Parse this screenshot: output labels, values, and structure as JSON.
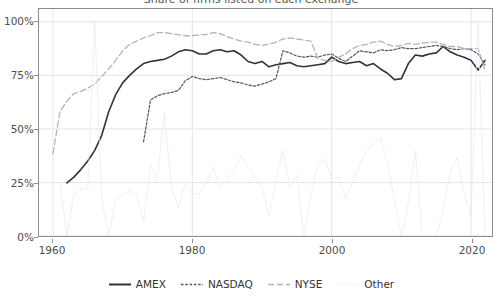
{
  "chart_data": {
    "type": "line",
    "title": "Share of firms listed on each exchange",
    "xlabel": "",
    "ylabel": "",
    "xlim": [
      1958,
      2023
    ],
    "ylim": [
      0,
      1.06
    ],
    "grid": true,
    "grid_color": "#e3e3ee",
    "legend_position": "bottom",
    "x_tick_labels": [
      "1960",
      "1980",
      "2000",
      "2020"
    ],
    "x_ticks": [
      1960,
      1980,
      2000,
      2020
    ],
    "y_tick_labels": [
      "0%",
      "25%",
      "50%",
      "75%",
      "100%"
    ],
    "y_ticks": [
      0,
      25,
      50,
      75,
      100
    ],
    "y_axis_unit": "percent",
    "series": [
      {
        "name": "AMEX",
        "color": "#333333",
        "dash": "solid",
        "width": 1.6,
        "x": [
          1962,
          1963,
          1964,
          1965,
          1966,
          1967,
          1968,
          1969,
          1970,
          1971,
          1972,
          1973,
          1974,
          1975,
          1976,
          1977,
          1978,
          1979,
          1980,
          1981,
          1982,
          1983,
          1984,
          1985,
          1986,
          1987,
          1988,
          1989,
          1990,
          1991,
          1992,
          1993,
          1994,
          1995,
          1996,
          1997,
          1998,
          1999,
          2000,
          2001,
          2002,
          2003,
          2004,
          2005,
          2006,
          2007,
          2008,
          2009,
          2010,
          2011,
          2012,
          2013,
          2014,
          2015,
          2016,
          2017,
          2018,
          2019,
          2020,
          2021,
          2022
        ],
        "values": [
          24.8,
          27.5,
          31.0,
          35.0,
          40.0,
          47.0,
          58.0,
          66.0,
          71.5,
          75.0,
          78.0,
          80.5,
          81.5,
          82.0,
          82.5,
          84.0,
          86.0,
          87.0,
          86.5,
          85.0,
          85.0,
          86.5,
          87.0,
          86.0,
          86.5,
          84.5,
          81.5,
          80.5,
          81.5,
          79.0,
          80.0,
          80.5,
          81.0,
          79.5,
          79.0,
          79.5,
          80.0,
          80.5,
          83.5,
          81.5,
          80.5,
          81.0,
          81.5,
          79.5,
          80.5,
          78.0,
          76.0,
          73.0,
          73.5,
          80.5,
          84.5,
          84.0,
          85.0,
          85.5,
          88.5,
          86.0,
          84.5,
          83.5,
          82.0,
          77.5,
          82.0
        ]
      },
      {
        "name": "NASDAQ",
        "color": "#555566",
        "dash": "dashed-fine",
        "width": 1.2,
        "x": [
          1973,
          1974,
          1975,
          1976,
          1977,
          1978,
          1979,
          1980,
          1981,
          1982,
          1983,
          1984,
          1985,
          1986,
          1987,
          1988,
          1989,
          1990,
          1991,
          1992,
          1993,
          1994,
          1995,
          1996,
          1997,
          1998,
          1999,
          2000,
          2001,
          2002,
          2003,
          2004,
          2005,
          2006,
          2007,
          2008,
          2009,
          2010,
          2011,
          2012,
          2013,
          2014,
          2015,
          2016,
          2017,
          2018,
          2019,
          2020,
          2021,
          2022
        ],
        "values": [
          44.0,
          63.5,
          65.5,
          66.5,
          67.0,
          68.0,
          72.5,
          74.5,
          73.5,
          73.0,
          73.5,
          74.0,
          73.0,
          72.0,
          71.5,
          70.5,
          70.0,
          71.0,
          72.0,
          73.5,
          86.5,
          85.5,
          84.0,
          83.5,
          84.0,
          83.5,
          84.5,
          85.0,
          83.0,
          81.5,
          84.0,
          86.5,
          86.0,
          85.5,
          87.0,
          86.5,
          87.0,
          88.0,
          87.5,
          87.5,
          88.0,
          88.5,
          89.0,
          88.5,
          87.5,
          87.0,
          87.5,
          87.0,
          85.0,
          80.0
        ]
      },
      {
        "name": "NYSE",
        "color": "#b3b3c4",
        "dash": "dashed-long",
        "width": 1.3,
        "x": [
          1960,
          1961,
          1962,
          1963,
          1964,
          1965,
          1966,
          1967,
          1968,
          1969,
          1970,
          1971,
          1972,
          1973,
          1974,
          1975,
          1976,
          1977,
          1978,
          1979,
          1980,
          1981,
          1982,
          1983,
          1984,
          1985,
          1986,
          1987,
          1988,
          1989,
          1990,
          1991,
          1992,
          1993,
          1994,
          1995,
          1996,
          1997,
          1998,
          1999,
          2000,
          2001,
          2002,
          2003,
          2004,
          2005,
          2006,
          2007,
          2008,
          2009,
          2010,
          2011,
          2012,
          2013,
          2014,
          2015,
          2016,
          2017,
          2018,
          2019,
          2020,
          2021,
          2022
        ],
        "values": [
          38.5,
          58.0,
          63.0,
          66.5,
          67.5,
          69.0,
          71.0,
          74.5,
          78.0,
          82.0,
          86.5,
          89.5,
          91.0,
          92.5,
          93.5,
          95.0,
          95.0,
          94.5,
          94.0,
          93.5,
          93.5,
          94.0,
          94.0,
          95.0,
          94.5,
          93.0,
          92.0,
          91.0,
          90.5,
          89.5,
          89.0,
          89.5,
          90.5,
          92.0,
          92.5,
          92.0,
          91.5,
          91.0,
          83.0,
          82.0,
          81.5,
          83.5,
          85.0,
          87.5,
          89.0,
          89.5,
          90.5,
          91.0,
          89.5,
          88.5,
          89.0,
          90.0,
          89.5,
          90.0,
          90.5,
          90.5,
          89.5,
          88.5,
          88.5,
          87.5,
          87.5,
          87.5,
          77.5
        ]
      },
      {
        "name": "Other",
        "color": "#e8e8f0",
        "dash": "dotted",
        "width": 1.0,
        "x": [
          1961,
          1962,
          1963,
          1964,
          1965,
          1966,
          1967,
          1968,
          1969,
          1970,
          1971,
          1972,
          1973,
          1974,
          1975,
          1976,
          1977,
          1978,
          1979,
          1980,
          1981,
          1982,
          1983,
          1984,
          1985,
          1986,
          1987,
          1988,
          1989,
          1990,
          1991,
          1992,
          1993,
          1994,
          1995,
          1996,
          1997,
          1998,
          1999,
          2000,
          2001,
          2002,
          2003,
          2004,
          2005,
          2006,
          2007,
          2008,
          2009,
          2010,
          2011,
          2012,
          2013,
          2014,
          2015,
          2016,
          2017,
          2018,
          2019,
          2020,
          2021,
          2022
        ],
        "values": [
          25.0,
          0.0,
          19.5,
          21.5,
          22.5,
          100.0,
          17.0,
          0.0,
          17.0,
          19.5,
          21.0,
          19.5,
          6.5,
          33.0,
          27.0,
          58.0,
          22.5,
          13.5,
          24.0,
          20.0,
          19.5,
          25.0,
          32.0,
          22.5,
          26.0,
          31.0,
          37.5,
          32.5,
          27.5,
          22.5,
          9.0,
          26.0,
          40.0,
          23.0,
          28.5,
          0.0,
          19.0,
          33.0,
          36.0,
          27.0,
          27.5,
          17.5,
          25.0,
          33.0,
          39.5,
          43.0,
          46.0,
          34.0,
          17.0,
          0.0,
          15.5,
          40.0,
          0.0,
          0.0,
          0.0,
          12.0,
          30.0,
          36.5,
          20.0,
          10.0,
          100.0,
          0.0
        ]
      }
    ]
  },
  "legend": {
    "entries": [
      {
        "label": "AMEX",
        "icon": "solid-line-swatch"
      },
      {
        "label": "NASDAQ",
        "icon": "dashed-line-swatch"
      },
      {
        "label": "NYSE",
        "icon": "longdash-line-swatch"
      },
      {
        "label": "Other",
        "icon": "dotted-line-swatch"
      }
    ]
  }
}
